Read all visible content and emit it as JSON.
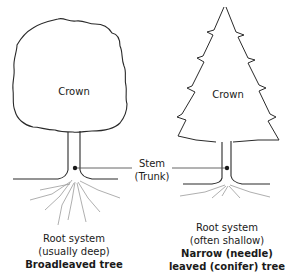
{
  "diagram": {
    "type": "labeled-illustration",
    "trees": [
      {
        "id": "broadleaf",
        "crown_label": "Crown",
        "root_label_line1": "Root system",
        "root_label_line2": "(usually deep)",
        "title": "Broadleaved tree"
      },
      {
        "id": "conifer",
        "crown_label": "Crown",
        "root_label_line1": "Root system",
        "root_label_line2": "(often shallow)",
        "title_line1": "Narrow (needle)",
        "title_line2": "leaved (conifer) tree"
      }
    ],
    "shared_label": {
      "line1": "Stem",
      "line2": "(Trunk)"
    },
    "colors": {
      "line": "#2a2a2a",
      "pointer": "#555555",
      "root": "#9a9a9a",
      "background": "#ffffff"
    }
  }
}
